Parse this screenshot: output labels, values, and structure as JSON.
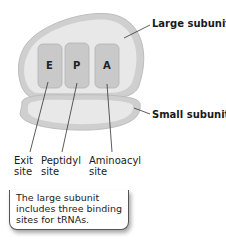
{
  "diagram": {
    "labels": {
      "large_subunit": "Large subunit",
      "small_subunit": "Small subunit"
    },
    "sites": [
      {
        "letter": "E",
        "name_line1": "Exit",
        "name_line2": "site"
      },
      {
        "letter": "P",
        "name_line1": "Peptidyl",
        "name_line2": "site"
      },
      {
        "letter": "A",
        "name_line1": "Aminoacyl",
        "name_line2": "site"
      }
    ],
    "caption": "The large subunit includes three binding sites for tRNAs.",
    "colors": {
      "subunit_outer": "#cfcfcf",
      "subunit_inner": "#e6e6e6",
      "site_fill": "#c9c9c9",
      "line": "#333333"
    }
  }
}
